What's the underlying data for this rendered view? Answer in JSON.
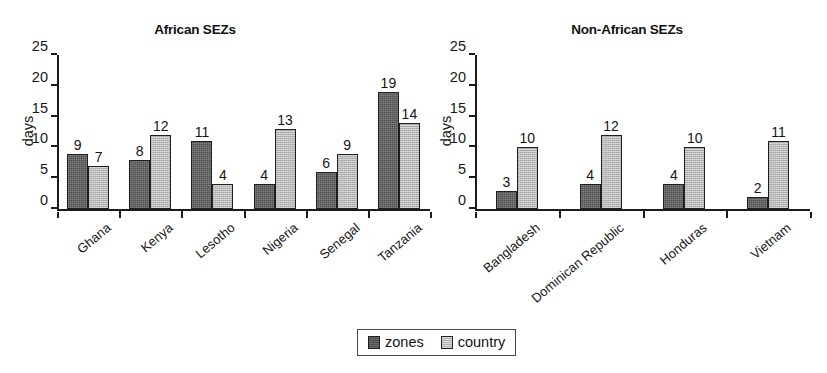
{
  "chart_data": [
    {
      "type": "bar",
      "title": "African SEZs",
      "xlabel": "",
      "ylabel": "days",
      "ylim": [
        0,
        25
      ],
      "yticks": [
        0,
        5,
        10,
        15,
        20,
        25
      ],
      "grid": false,
      "legend_position": "bottom-center",
      "categories": [
        "Ghana",
        "Kenya",
        "Lesotho",
        "Nigeria",
        "Senegal",
        "Tanzania"
      ],
      "series": [
        {
          "name": "zones",
          "values": [
            9,
            8,
            11,
            4,
            6,
            19
          ]
        },
        {
          "name": "country",
          "values": [
            7,
            12,
            4,
            13,
            9,
            14
          ]
        }
      ]
    },
    {
      "type": "bar",
      "title": "Non-African SEZs",
      "xlabel": "",
      "ylabel": "days",
      "ylim": [
        0,
        25
      ],
      "yticks": [
        0,
        5,
        10,
        15,
        20,
        25
      ],
      "grid": false,
      "legend_position": "bottom-center",
      "categories": [
        "Bangladesh",
        "Dominican Republic",
        "Honduras",
        "Vietnam"
      ],
      "series": [
        {
          "name": "zones",
          "values": [
            3,
            4,
            4,
            2
          ]
        },
        {
          "name": "country",
          "values": [
            10,
            12,
            10,
            11
          ]
        }
      ]
    }
  ],
  "legend": {
    "entries": [
      {
        "label": "zones",
        "color": "#4e4e4e"
      },
      {
        "label": "country",
        "color": "#b5b5b5"
      }
    ]
  },
  "colors": {
    "zones": "#4e4e4e",
    "country": "#b5b5b5",
    "axis": "#1c1c1c",
    "text": "#141414",
    "background": "#ffffff"
  }
}
